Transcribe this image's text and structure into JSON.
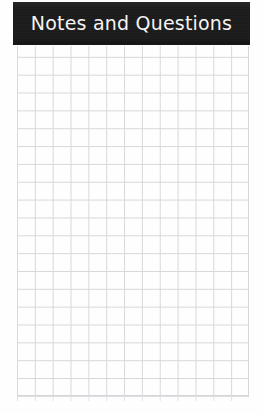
{
  "page": {
    "background_color": "#fefefe",
    "width": 263,
    "height": 413
  },
  "header": {
    "title": "Notes and Questions",
    "background_color": "#1b1b1b",
    "text_color": "#f4f4f4"
  },
  "grid": {
    "line_color": "#d6d7da",
    "cell_size_px": 17.85,
    "columns": 13,
    "rows": 19,
    "description": "blank square-ruled note grid"
  }
}
